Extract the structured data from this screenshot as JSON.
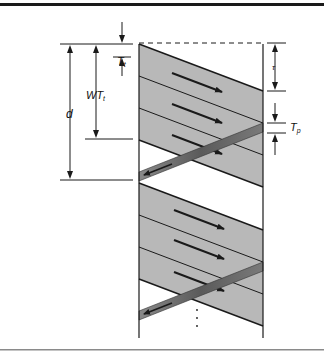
{
  "figure": {
    "type": "sliding-window timing diagram",
    "labels": {
      "transmission_time": "T",
      "transmission_time_sub": "t",
      "window_time": "WT",
      "window_time_sub": "t",
      "distance": "d",
      "propagation_delay": "τ",
      "ack_time": "T",
      "ack_time_sub": "p",
      "continuation": "⋮"
    },
    "colors": {
      "frame_fill": "#b8b8b8",
      "ack_fill": "#6e6e6e",
      "line": "#1a1a1a",
      "border_top": "#1a1a1a",
      "border_bottom": "#8a8a8a"
    },
    "frames_per_window": 3,
    "windows_shown": 2
  }
}
